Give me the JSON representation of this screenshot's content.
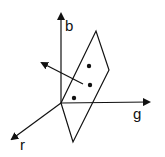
{
  "diagram": {
    "axes": {
      "b_label": "b",
      "g_label": "g",
      "r_label": "r"
    }
  }
}
